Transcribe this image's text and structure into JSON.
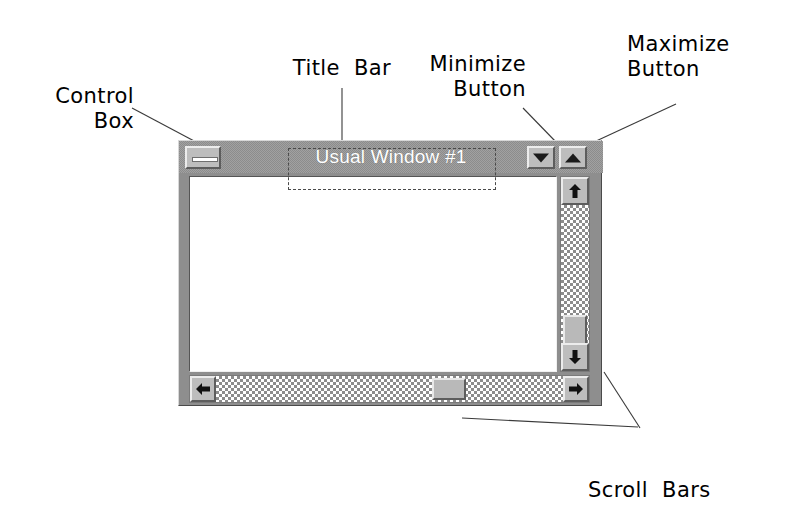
{
  "annotations": {
    "control_box": "Control\nBox",
    "title_bar": "Title  Bar",
    "minimize_button": "Minimize\nButton",
    "maximize_button": "Maximize\nButton",
    "scroll_bars": "Scroll  Bars"
  },
  "properties": {
    "caption": {
      "object": "Form",
      "name": ".Caption"
    },
    "control_box": {
      "object": "Form",
      "name": ".ControlBox"
    },
    "min_button": {
      "object": "Form",
      "name": ".MinButton"
    },
    "max_button": {
      "object": "Form",
      "name": ".MaxButton"
    }
  },
  "window": {
    "title": "Usual Window #1",
    "control_box_icon": "minimize-bar-icon",
    "min_button_icon": "triangle-down-icon",
    "max_button_icon": "triangle-up-icon",
    "vertical_scrollbar": {
      "up_icon": "arrow-up-icon",
      "down_icon": "arrow-down-icon",
      "thumb": "scroll-thumb"
    },
    "horizontal_scrollbar": {
      "left_icon": "arrow-left-icon",
      "right_icon": "arrow-right-icon",
      "thumb": "scroll-thumb"
    }
  },
  "colors": {
    "titlebar": "#8c8c8c",
    "frame": "#8e8e8e",
    "button_face": "#bdbdbd",
    "client": "#ffffff",
    "title_text": "#ffffff",
    "ink": "#000000"
  }
}
